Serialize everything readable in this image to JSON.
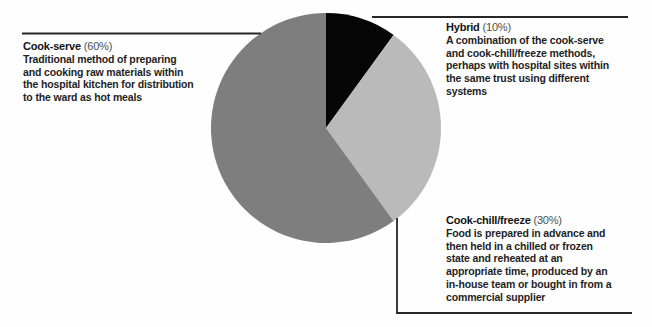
{
  "chart_data": {
    "type": "pie",
    "start_at": "top",
    "direction": "clockwise",
    "legend_position": "none",
    "slices": [
      {
        "label": "Hybrid",
        "value": 10,
        "color": "#050505"
      },
      {
        "label": "Cook-chill/freeze",
        "value": 30,
        "color": "#bababa"
      },
      {
        "label": "Cook-serve",
        "value": 60,
        "color": "#7e7e7e"
      }
    ],
    "annotations": [
      {
        "title": "Cook-serve",
        "pct_text": "(60%)",
        "desc_lines": [
          "Traditional method of preparing",
          "and cooking raw materials within",
          "the hospital kitchen for distribution",
          "to the ward as hot meals"
        ]
      },
      {
        "title": "Hybrid",
        "pct_text": "(10%)",
        "desc_lines": [
          "A combination of the cook-serve",
          "and cook-chill/freeze methods,",
          "perhaps with hospital sites within",
          "the same trust using different",
          "systems"
        ]
      },
      {
        "title": "Cook-chill/freeze",
        "pct_text": "(30%)",
        "desc_lines": [
          "Food is prepared in advance and",
          "then held in a chilled or frozen",
          "state and reheated at an",
          "appropriate time, produced by an",
          "in-house team or bought in from a",
          "commercial supplier"
        ]
      }
    ],
    "line_color": "#262626"
  }
}
